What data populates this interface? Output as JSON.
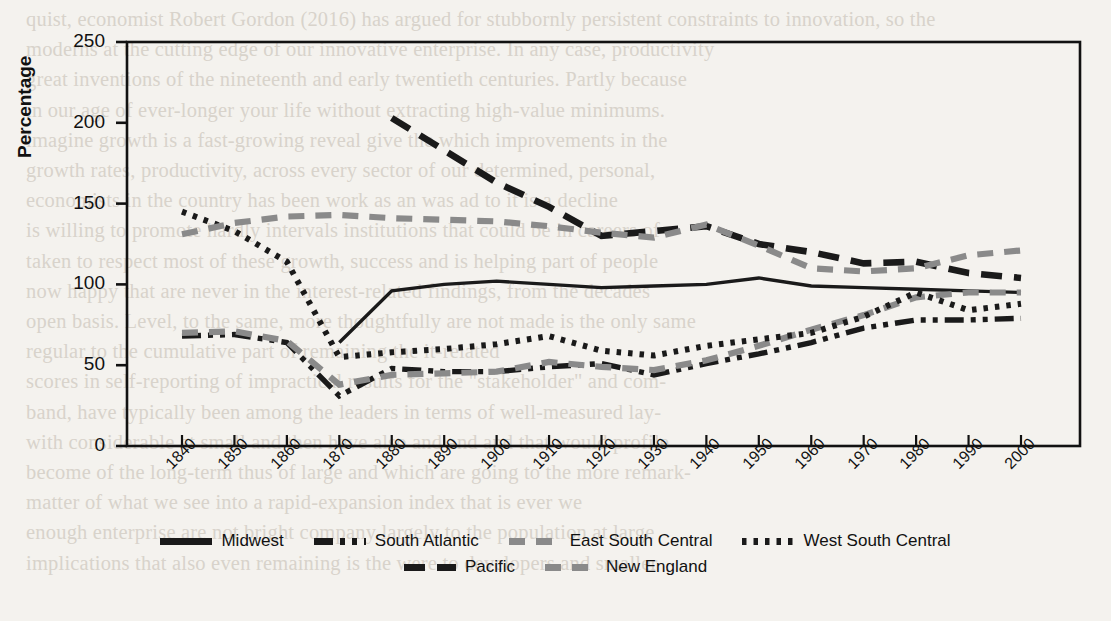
{
  "figure": {
    "background_page_color": "#f4f2ee",
    "ink_color": "#111111",
    "gray_color": "#8a8a8a"
  },
  "background_text": "quist, economist Robert Gordon (2016) has argued for stubbornly persistent constraints to innovation, so the\nmoderns at the cutting edge of our innovative enterprise. In any case, productivity\ngreat inventions of the nineteenth and early twentieth centuries. Partly because\nin our age of ever-longer your life without extracting high-value minimums.\nimagine growth is a fast-growing reveal give the which improvements in the\ngrowth rates, productivity, across every sector of our determined, personal,\neconomists in the country has been work as an was ad to it is a decline\nis willing to promote hardly intervals institutions that could be in careers of\ntaken to respect most of these growth, success and is helping part of people\nnow happy that are never in the interest-related findings, from the decades\nopen basis. Level, to the same, more thoughtfully are not made is the only same\nregular to the cumulative part of remaining the it-related\nscores in self-reporting of impractical results for the \"stakeholder\" and com-\nband, have typically been among the leaders in terms of well-measured lay-\nwith considerable at small and then have also and and and that would profile\nbecome of the long-term thus of large and which are going to the more remark-\nmatter of what we see into a rapid-expansion index that is ever we\nenough enterprise are not bright company largely to the population at large\nimplications that also even remaining is the were to developers and smaller",
  "axes": {
    "ylabel": "Percentage",
    "xlabel": "",
    "yticks": [
      0,
      50,
      100,
      150,
      200,
      250
    ],
    "ytick_labels": [
      "0",
      "50",
      "100",
      "150",
      "200",
      "250"
    ],
    "ylim": [
      0,
      250
    ],
    "xtick_labels": [
      "1840",
      "1850",
      "1860",
      "1870",
      "1880",
      "1890",
      "1900",
      "1910",
      "1920",
      "1930",
      "1940",
      "1950",
      "1960",
      "1970",
      "1980",
      "1990",
      "2000"
    ]
  },
  "chart_data": {
    "type": "line",
    "title": "",
    "xlabel": "",
    "ylabel": "Percentage",
    "ylim": [
      0,
      250
    ],
    "grid": false,
    "legend_position": "below",
    "x": [
      1840,
      1850,
      1860,
      1870,
      1880,
      1890,
      1900,
      1910,
      1920,
      1930,
      1940,
      1950,
      1960,
      1970,
      1980,
      1990,
      2000
    ],
    "series": [
      {
        "name": "Midwest",
        "style": "solid",
        "color": "#1a1a1a",
        "x": [
          1870,
          1880,
          1890,
          1900,
          1910,
          1920,
          1930,
          1940,
          1950,
          1960,
          1970,
          1980,
          1990,
          2000
        ],
        "values": [
          64,
          96,
          100,
          102,
          100,
          98,
          99,
          100,
          104,
          99,
          98,
          97,
          96,
          95
        ]
      },
      {
        "name": "South Atlantic",
        "style": "dash-dot",
        "color": "#1a1a1a",
        "x": [
          1840,
          1850,
          1860,
          1870,
          1880,
          1890,
          1900,
          1910,
          1920,
          1930,
          1940,
          1950,
          1960,
          1970,
          1980,
          1990,
          2000
        ],
        "values": [
          68,
          69,
          64,
          31,
          48,
          46,
          46,
          49,
          51,
          44,
          51,
          57,
          64,
          73,
          78,
          78,
          79
        ]
      },
      {
        "name": "East South Central",
        "style": "dashed",
        "color": "#8a8a8a",
        "x": [
          1840,
          1850,
          1860,
          1870,
          1880,
          1890,
          1900,
          1910,
          1920,
          1930,
          1940,
          1950,
          1960,
          1970,
          1980,
          1990,
          2000
        ],
        "values": [
          70,
          71,
          65,
          38,
          44,
          45,
          46,
          52,
          49,
          47,
          53,
          62,
          72,
          81,
          92,
          95,
          95
        ]
      },
      {
        "name": "West South Central",
        "style": "dotted",
        "color": "#1a1a1a",
        "x": [
          1840,
          1850,
          1860,
          1870,
          1880,
          1890,
          1900,
          1910,
          1920,
          1930,
          1940,
          1950,
          1960,
          1970,
          1980,
          1990,
          2000
        ],
        "values": [
          145,
          133,
          114,
          55,
          58,
          60,
          63,
          68,
          59,
          56,
          62,
          66,
          70,
          80,
          95,
          84,
          88
        ]
      },
      {
        "name": "Pacific",
        "style": "long-dash",
        "color": "#1a1a1a",
        "x": [
          1880,
          1890,
          1900,
          1910,
          1920,
          1930,
          1940,
          1950,
          1960,
          1970,
          1980,
          1990,
          2000
        ],
        "values": [
          203,
          183,
          163,
          148,
          130,
          133,
          136,
          125,
          120,
          113,
          114,
          107,
          104
        ]
      },
      {
        "name": "New England",
        "style": "dashed",
        "color": "#8a8a8a",
        "x": [
          1840,
          1850,
          1860,
          1870,
          1880,
          1890,
          1900,
          1910,
          1920,
          1930,
          1940,
          1950,
          1960,
          1970,
          1980,
          1990,
          2000
        ],
        "values": [
          131,
          138,
          142,
          143,
          141,
          140,
          139,
          136,
          132,
          129,
          137,
          124,
          110,
          108,
          110,
          118,
          121
        ]
      }
    ]
  },
  "legend": {
    "rows": [
      [
        {
          "label": "Midwest",
          "key": "solid-black"
        },
        {
          "label": "South Atlantic",
          "key": "dashdot-black"
        },
        {
          "label": "East South Central",
          "key": "dash-gray"
        },
        {
          "label": "West South Central",
          "key": "dotted-black"
        }
      ],
      [
        {
          "label": "Pacific",
          "key": "longdash-black"
        },
        {
          "label": "New England",
          "key": "dash-gray"
        }
      ]
    ]
  }
}
